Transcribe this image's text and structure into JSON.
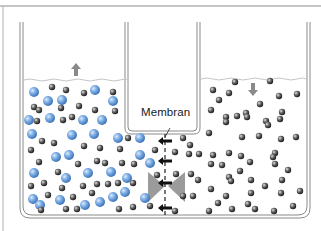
{
  "diagram": {
    "membrane_label": "Membran",
    "left_compartment": {
      "water_level_change": "rising",
      "arrow_direction": "up",
      "particles": [
        "solute (blue)",
        "water (gray)"
      ]
    },
    "right_compartment": {
      "water_level_change": "falling",
      "arrow_direction": "down",
      "particles": [
        "water (gray)"
      ]
    },
    "flow_arrows": {
      "count": 4,
      "direction": "left",
      "meaning": "water flows through membrane into solute side"
    },
    "colors": {
      "solute": "#6fa3dc",
      "water_particle": "#5a5a5a",
      "container_outline": "#8a8a8a",
      "water_surface": "#c8c8c8",
      "flow_arrow": "#111111",
      "pressure_triangle": "#808080"
    }
  }
}
